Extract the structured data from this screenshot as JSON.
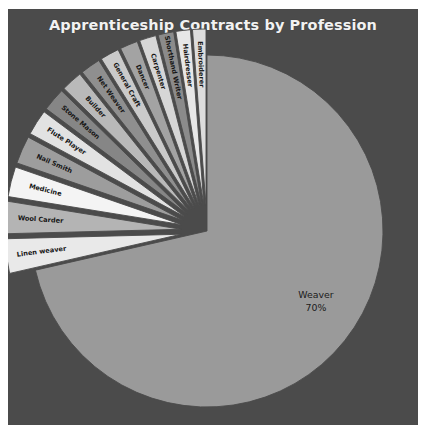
{
  "figure": {
    "background_color": "#4b4b4b",
    "page_background": "#ffffff",
    "title_color": "#f2f2f2"
  },
  "chart_data": {
    "type": "pie",
    "title": "Apprenticeship Contracts by Profession",
    "xlabel": "",
    "ylabel": "",
    "legend": "none",
    "grid": false,
    "startangle": 90,
    "counterclock": false,
    "labels": [
      "Weaver",
      "Linen weaver",
      "Wool Carder",
      "Medicine",
      "Nail Smith",
      "Flute Player",
      "Stone Mason",
      "Builder",
      "Net Weaver",
      "General Craft",
      "Dancer",
      "Carpenter",
      "Shorthand Writer",
      "Hairdresser",
      "Embroiderer"
    ],
    "values": [
      70,
      3.1,
      2.9,
      2.7,
      2.5,
      2.3,
      2.1,
      1.9,
      1.8,
      1.7,
      1.6,
      1.5,
      1.4,
      1.3,
      1.2
    ],
    "displayed_value_labels": [
      "70%",
      "",
      "",
      "",
      "",
      "",
      "",
      "",
      "",
      "",
      "",
      "",
      "",
      "",
      ""
    ],
    "exploded": [
      false,
      true,
      true,
      true,
      true,
      true,
      true,
      true,
      true,
      true,
      true,
      true,
      true,
      true,
      true
    ],
    "slice_colors": [
      "#9a9a9a",
      "#e9e9e9",
      "#b4b4b4",
      "#f4f4f4",
      "#9d9d9d",
      "#e2e2e2",
      "#868686",
      "#b9b9b9",
      "#8f8f8f",
      "#cacaca",
      "#a3a3a3",
      "#d6d6d6",
      "#8b8b8b",
      "#e7e7e7",
      "#dddddd"
    ],
    "label_text_color": "#161616",
    "big_slice_label": "Weaver",
    "big_slice_percent": "70%"
  }
}
